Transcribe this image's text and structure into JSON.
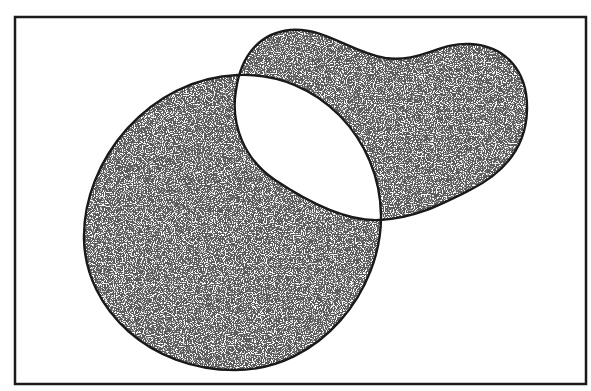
{
  "diagram": {
    "type": "venn",
    "frame": {
      "x": 15,
      "y": 17,
      "width": 571,
      "height": 367,
      "stroke": "#1a1a1a"
    },
    "colors": {
      "background": "#ffffff",
      "outline": "#1a1a1a",
      "stipple": "#2a2a2a"
    },
    "sets": [
      {
        "id": "set-a",
        "shape": "circle",
        "fill": "stippled"
      },
      {
        "id": "set-b",
        "shape": "blob",
        "fill": "stippled"
      }
    ],
    "intersection": {
      "fill": "blank"
    }
  }
}
